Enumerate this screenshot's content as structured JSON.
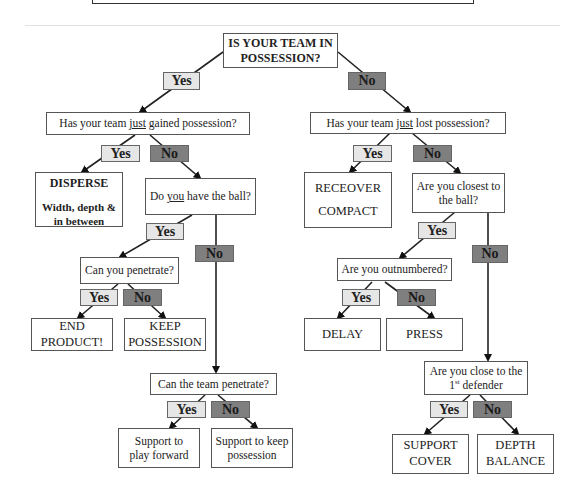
{
  "diagram": {
    "root": {
      "line1": "IS YOUR TEAM IN",
      "line2": "POSSESSION?"
    },
    "labels": {
      "yes": "Yes",
      "no": "No"
    },
    "colors": {
      "yes_fill": "#e6e6e6",
      "no_fill": "#7f7f7f",
      "border": "#555555"
    },
    "left": {
      "q1": {
        "pre": "Has your team ",
        "u": "just",
        "post": " gained possession?"
      },
      "disperse": {
        "title": "DISPERSE",
        "sub": "Width, depth &\nin between"
      },
      "q2": {
        "pre": "Do ",
        "u": "you",
        "post": " have the ball?"
      },
      "q3": "Can you penetrate?",
      "end_product": "END\nPRODUCT!",
      "keep_possession": "KEEP\nPOSSESSION",
      "q4": "Can the team penetrate?",
      "support_forward": "Support to\nplay forward",
      "support_keep": "Support to keep\npossession"
    },
    "right": {
      "q1": {
        "pre": "Has your team ",
        "u": "just",
        "post": " lost possession?"
      },
      "recover": {
        "line1": "RECEOVER",
        "line2": "COMPACT"
      },
      "q2": "Are you closest to\nthe ball?",
      "q3": "Are you outnumbered?",
      "delay": "DELAY",
      "press": "PRESS",
      "q4": {
        "pre": "Are you close to the",
        "num": "1",
        "sup": "st",
        "post": " defender"
      },
      "support_cover": "SUPPORT\nCOVER",
      "depth_balance": "DEPTH\nBALANCE"
    }
  }
}
